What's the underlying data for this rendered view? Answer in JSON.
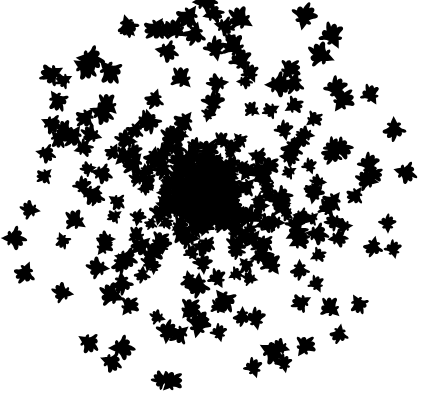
{
  "artwork": {
    "title": "Radial Bird Cluster",
    "kind": "generative-silhouette-cluster",
    "width": 426,
    "height": 418,
    "background_color": "#ffffff",
    "shape_color": "#000000",
    "description": "Abstract generative composition: many small black bird/arrow silhouettes scattered in a roughly circular cluster whose density falls off from a dense black core toward sparse isolated motifs near the edges. Each motif is randomly rotated and varies slightly in size."
  },
  "motif": {
    "name": "bird-arrow-silhouette",
    "base_size": 21,
    "path": "M 0,-1.00 C 0.10,-0.78 0.20,-0.62 0.26,-0.48 C 0.38,-0.54 0.50,-0.50 0.55,-0.40 C 0.52,-0.30 0.44,-0.26 0.36,-0.26 C 0.46,-0.14 0.58,-0.06 0.72,-0.02 C 0.86,0.02 0.95,0.10 0.92,0.20 C 0.84,0.28 0.70,0.26 0.58,0.22 C 0.62,0.34 0.58,0.46 0.46,0.52 C 0.36,0.56 0.28,0.50 0.22,0.42 C 0.18,0.56 0.12,0.70 0.04,0.82 C -0.02,0.92 -0.10,0.96 -0.16,0.90 C -0.20,0.80 -0.18,0.66 -0.16,0.54 C -0.26,0.62 -0.38,0.66 -0.48,0.60 C -0.56,0.52 -0.54,0.40 -0.48,0.30 C -0.60,0.32 -0.74,0.30 -0.82,0.22 C -0.88,0.12 -0.82,0.02 -0.70,-0.02 C -0.56,-0.06 -0.42,-0.14 -0.32,-0.26 C -0.42,-0.28 -0.50,-0.34 -0.52,-0.42 C -0.48,-0.52 -0.36,-0.54 -0.24,-0.48 C -0.18,-0.64 -0.09,-0.80 0,-1.00 Z"
  },
  "cluster": {
    "center_x": 205,
    "center_y": 190,
    "core_radius": 34,
    "max_radius": 205,
    "shape_count": 470,
    "density_falloff": 2.35,
    "size_min_scale": 0.62,
    "size_max_scale": 1.18,
    "size_growth_with_radius": 0.34,
    "jitter": 7,
    "random_seed": 20240517,
    "rotation_mode": "random-full-turn"
  },
  "labels": {
    "empty_note": ""
  }
}
